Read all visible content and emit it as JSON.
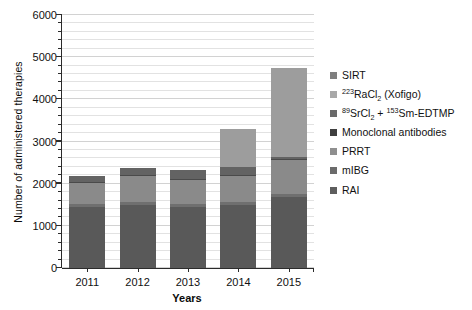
{
  "chart_data": {
    "type": "bar",
    "subtype": "stacked-bar",
    "title": "",
    "xlabel": "Years",
    "ylabel": "Number of administered therapies",
    "categories": [
      "2011",
      "2012",
      "2013",
      "2014",
      "2015"
    ],
    "ylim": [
      0,
      6000
    ],
    "ytick_labels": [
      "0",
      "1000",
      "2000",
      "3000",
      "4000",
      "5000",
      "6000"
    ],
    "ytick_values": [
      0,
      1000,
      2000,
      3000,
      4000,
      5000,
      6000
    ],
    "ytick_minor_step": 200,
    "grid": true,
    "grid_axis": "y",
    "legend_position": "right",
    "series": [
      {
        "name": "RAI",
        "label": "RAI",
        "color": "#595959",
        "values": [
          1450,
          1500,
          1450,
          1500,
          1680
        ]
      },
      {
        "name": "mIBG",
        "label": "mIBG",
        "color": "#6f6f6f",
        "values": [
          60,
          60,
          60,
          70,
          80
        ]
      },
      {
        "name": "PRRT",
        "label": "PRRT",
        "color": "#8a8a8a",
        "values": [
          510,
          620,
          570,
          610,
          800
        ]
      },
      {
        "name": "Monoclonal antibodies",
        "label": "Monoclonal antibodies",
        "color": "#4a4a4a",
        "values": [
          30,
          25,
          25,
          25,
          20
        ]
      },
      {
        "name": "89SrCl2 + 153Sm-EDTMP",
        "label": "89SrCl2 + 153Sm-EDTMP",
        "color": "#636363",
        "values": [
          130,
          175,
          225,
          195,
          60
        ]
      },
      {
        "name": "223RaCl2 (Xofigo)",
        "label": "223RaCl2 (Xofigo)",
        "color": "#9d9d9d",
        "values": [
          0,
          0,
          0,
          900,
          2110
        ]
      },
      {
        "name": "SIRT",
        "label": "SIRT",
        "color": "#808080",
        "values": [
          0,
          0,
          0,
          0,
          0
        ]
      }
    ],
    "totals": [
      2180,
      2380,
      2330,
      3300,
      4750
    ],
    "annotations": []
  },
  "legend": {
    "entries": [
      {
        "label": "SIRT",
        "color": "#7f7f7f",
        "html": "SIRT"
      },
      {
        "label": "223RaCl2 (Xofigo)",
        "color": "#a8a8a8",
        "html": "<sup>223</sup>RaCl<sub>2</sub> (Xofigo)"
      },
      {
        "label": "89SrCl2 + 153Sm-EDTMP",
        "color": "#6a6a6a",
        "html": "<sup>89</sup>SrCl<sub>2</sub> + <sup>153</sup>Sm-EDTMP"
      },
      {
        "label": "Monoclonal antibodies",
        "color": "#3f3f3f",
        "html": "Monoclonal antibodies"
      },
      {
        "label": "PRRT",
        "color": "#8f8f8f",
        "html": "PRRT"
      },
      {
        "label": "mIBG",
        "color": "#6b6b6b",
        "html": "mIBG"
      },
      {
        "label": "RAI",
        "color": "#5e5e5e",
        "html": "RAI"
      }
    ]
  },
  "colors": {
    "background": "#ffffff",
    "axis": "#2b2b2b",
    "gridline": "#e2e2e2",
    "text": "#111111"
  }
}
